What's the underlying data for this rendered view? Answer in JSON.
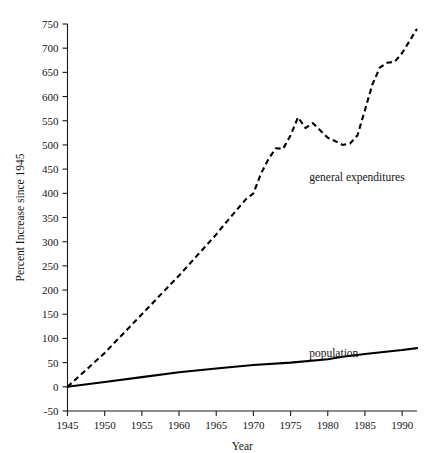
{
  "chart_data": {
    "type": "line",
    "title": "",
    "xlabel": "Year",
    "ylabel": "Percent Increase since 1945",
    "xlim": [
      1945,
      1992
    ],
    "ylim": [
      -50,
      750
    ],
    "xticks": [
      1945,
      1950,
      1955,
      1960,
      1965,
      1970,
      1975,
      1980,
      1985,
      1990
    ],
    "yticks": [
      -50,
      0,
      50,
      100,
      150,
      200,
      250,
      300,
      350,
      400,
      450,
      500,
      550,
      600,
      650,
      700,
      750
    ],
    "grid": false,
    "legend_position": "inline-annotation",
    "series": [
      {
        "name": "general expenditures",
        "style": "dashed",
        "label_x": 1977.5,
        "label_y": 425,
        "x": [
          1945,
          1946,
          1947,
          1948,
          1949,
          1950,
          1951,
          1952,
          1953,
          1954,
          1955,
          1956,
          1957,
          1958,
          1959,
          1960,
          1961,
          1962,
          1963,
          1964,
          1965,
          1966,
          1967,
          1968,
          1969,
          1970,
          1971,
          1972,
          1973,
          1974,
          1975,
          1976,
          1977,
          1978,
          1979,
          1980,
          1981,
          1982,
          1983,
          1984,
          1985,
          1986,
          1987,
          1988,
          1989,
          1990,
          1991,
          1992
        ],
        "values": [
          0,
          14,
          28,
          42,
          56,
          70,
          86,
          102,
          118,
          134,
          150,
          166,
          182,
          198,
          214,
          230,
          247,
          264,
          281,
          298,
          315,
          334,
          352,
          370,
          388,
          400,
          440,
          470,
          493,
          492,
          520,
          557,
          535,
          545,
          530,
          515,
          508,
          500,
          503,
          520,
          572,
          625,
          660,
          670,
          672,
          690,
          715,
          740
        ]
      },
      {
        "name": "population",
        "style": "solid",
        "label_x": 1977.5,
        "label_y": 62,
        "x": [
          1945,
          1950,
          1955,
          1960,
          1965,
          1970,
          1975,
          1980,
          1982,
          1985,
          1990,
          1992
        ],
        "values": [
          0,
          10,
          20,
          30,
          38,
          45,
          50,
          57,
          62,
          68,
          76,
          80
        ]
      }
    ]
  }
}
